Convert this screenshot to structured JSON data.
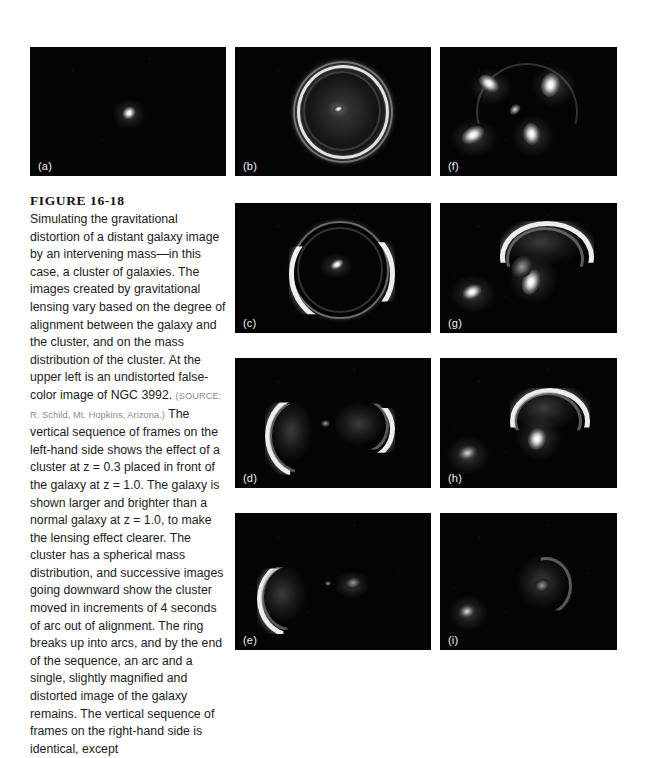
{
  "figure": {
    "number": "FIGURE 16-18",
    "caption_part1": "Simulating the gravitational distortion of a distant galaxy image by an intervening mass—in this case, a cluster of galaxies. The images created by gravitational lensing vary based on the degree of alignment between the galaxy and the cluster, and on the mass distribution of the cluster. At the upper left is an undistorted false-color image of NGC 3992. ",
    "source": "(SOURCE: R. Schild, Mt. Hopkins, Arizona.)",
    "caption_part2": " The vertical sequence of frames on the left-hand side shows the effect of a cluster at z = 0.3 placed in front of the galaxy at z = 1.0. The galaxy is shown larger and brighter than a normal galaxy at z = 1.0, to make the lensing effect clearer. The cluster has a spherical mass distribution, and successive images going downward show the cluster moved in increments of 4 seconds of arc out of alignment. The ring breaks up into arcs, and by the end of the sequence, an arc and a single, slightly magnified and distorted image of the galaxy remains. The vertical sequence of frames on the right-hand side is identical, except"
  },
  "panels": [
    {
      "id": "a",
      "label": "(a)",
      "description": "undistorted false-color image of NGC 3992, small bright galaxy near center"
    },
    {
      "id": "b",
      "label": "(b)",
      "description": "complete Einstein ring with bright point source at center"
    },
    {
      "id": "c",
      "label": "(c)",
      "description": "ring breaking up, bright arcs on left and right with central image"
    },
    {
      "id": "d",
      "label": "(d)",
      "description": "two opposing crescent arcs, left arc and right arc"
    },
    {
      "id": "e",
      "label": "(e)",
      "description": "single bright arc at left and faint galaxy image at right"
    },
    {
      "id": "f",
      "label": "(f)",
      "description": "four lensed images arranged around center, arcs at upper left and upper right, blobs lower left and lower center"
    },
    {
      "id": "g",
      "label": "(g)",
      "description": "bright elongated arc at top, blob at center, blob at lower left"
    },
    {
      "id": "h",
      "label": "(h)",
      "description": "bright arc upper right, teardrop blob below it, faint blob lower left"
    },
    {
      "id": "i",
      "label": "(i)",
      "description": "diffuse arc right of center and faint galaxy image lower left"
    }
  ],
  "colors": {
    "page_background": "#ffffff",
    "panel_background": "#040404",
    "feature_highlight": "#ffffff",
    "caption_text": "#1c1c1c",
    "source_text": "#8a8a8a"
  }
}
